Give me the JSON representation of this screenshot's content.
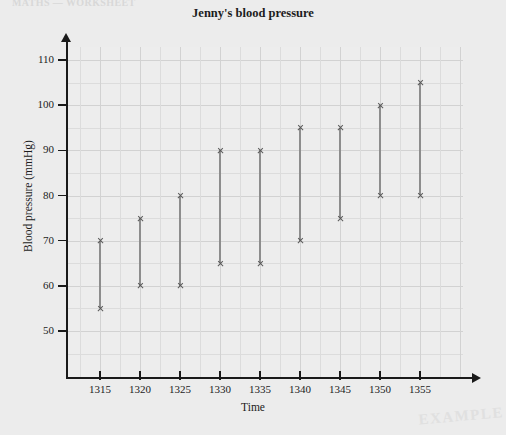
{
  "page": {
    "scan_header_text": "MATHS — WORKSHEET",
    "watermark_text": "EXAMPLE"
  },
  "chart_data": {
    "type": "bar",
    "title": "Jenny's blood pressure",
    "xlabel": "Time",
    "ylabel": "Blood pressure (mmHg)",
    "grid": true,
    "legend": "none",
    "categories": [
      "1315",
      "1320",
      "1325",
      "1330",
      "1335",
      "1340",
      "1345",
      "1350",
      "1355"
    ],
    "x": [
      1315,
      1320,
      1325,
      1330,
      1335,
      1340,
      1345,
      1350,
      1355
    ],
    "xlim": [
      1310,
      1360
    ],
    "ylim": [
      45,
      113
    ],
    "ytick_labels": [
      "110",
      "100",
      "90",
      "80",
      "70",
      "60",
      "50"
    ],
    "yticks": [
      110,
      100,
      90,
      80,
      70,
      60,
      50
    ],
    "xtick_labels": [
      "1315",
      "1320",
      "1325",
      "1330",
      "1335",
      "1340",
      "1345",
      "1350",
      "1355"
    ],
    "series": [
      {
        "name": "Systolic (upper marker)",
        "values": [
          70,
          75,
          80,
          90,
          90,
          95,
          95,
          100,
          105
        ]
      },
      {
        "name": "Diastolic (lower marker)",
        "values": [
          55,
          60,
          60,
          65,
          65,
          70,
          75,
          80,
          80
        ]
      }
    ],
    "ranges": [
      {
        "time": "1315",
        "high": 70,
        "low": 55
      },
      {
        "time": "1320",
        "high": 75,
        "low": 60
      },
      {
        "time": "1325",
        "high": 80,
        "low": 60
      },
      {
        "time": "1330",
        "high": 90,
        "low": 65
      },
      {
        "time": "1335",
        "high": 90,
        "low": 65
      },
      {
        "time": "1340",
        "high": 95,
        "low": 70
      },
      {
        "time": "1345",
        "high": 95,
        "low": 75
      },
      {
        "time": "1350",
        "high": 100,
        "low": 80
      },
      {
        "time": "1355",
        "high": 105,
        "low": 80
      }
    ]
  }
}
